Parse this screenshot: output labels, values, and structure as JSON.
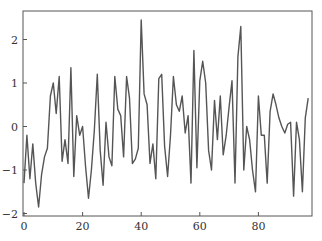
{
  "chart_data": {
    "type": "line",
    "title": "",
    "xlabel": "",
    "ylabel": "",
    "xlim": [
      0,
      99
    ],
    "ylim": [
      -2.05,
      2.6
    ],
    "grid": false,
    "legend": null,
    "x_ticks": [
      0,
      20,
      40,
      60,
      80
    ],
    "y_ticks": [
      -2,
      -1,
      0,
      1,
      2
    ],
    "x_tick_labels": [
      "0",
      "20",
      "40",
      "60",
      "80"
    ],
    "y_tick_labels": [
      "−2",
      "−1",
      "0",
      "1",
      "2"
    ],
    "line_color": "#555555",
    "series": [
      {
        "name": "series",
        "values": [
          -1.3,
          -0.2,
          -1.2,
          -0.4,
          -1.3,
          -1.85,
          -1.1,
          -0.7,
          -0.5,
          0.7,
          1.0,
          0.3,
          1.15,
          -0.8,
          -0.3,
          -0.85,
          1.35,
          -1.15,
          0.25,
          -0.2,
          0.0,
          -0.9,
          -1.65,
          -1.0,
          -0.1,
          1.2,
          -0.55,
          -1.35,
          0.1,
          -0.7,
          -0.9,
          1.15,
          0.4,
          0.25,
          -0.7,
          1.15,
          0.65,
          -0.85,
          -0.75,
          -0.5,
          2.45,
          0.75,
          0.5,
          -0.85,
          -0.4,
          -1.2,
          1.1,
          1.2,
          -0.45,
          -1.15,
          -0.2,
          1.15,
          0.5,
          0.35,
          0.7,
          -0.15,
          0.25,
          -1.3,
          1.75,
          -0.95,
          1.05,
          1.5,
          1.0,
          -0.55,
          -1.0,
          0.6,
          -0.3,
          0.7,
          -0.65,
          -0.2,
          0.45,
          1.05,
          -1.3,
          1.6,
          2.3,
          -1.0,
          0.0,
          -0.3,
          -1.0,
          -1.5,
          0.7,
          -0.2,
          -0.2,
          -1.3,
          0.35,
          0.75,
          0.5,
          0.2,
          0.0,
          -0.15,
          0.05,
          0.1,
          -1.6,
          0.1,
          -0.3,
          -1.5,
          0.2,
          0.65
        ]
      }
    ]
  }
}
